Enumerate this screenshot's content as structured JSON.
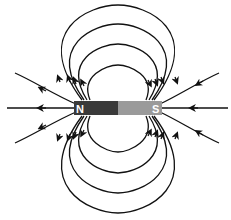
{
  "diagram": {
    "magnet": {
      "north_label": "N",
      "south_label": "S",
      "north_color": "#3a3a3a",
      "south_color": "#9a9a9a"
    },
    "field_line_color": "#111111",
    "arrow_direction": "from N to S (outside the magnet)"
  }
}
